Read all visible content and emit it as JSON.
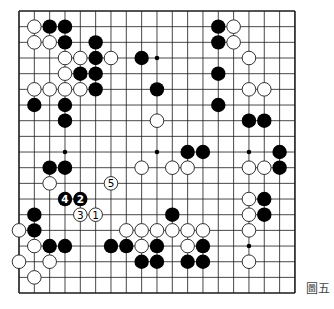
{
  "diagram": {
    "type": "go-board",
    "size": 19,
    "caption": "圖五",
    "colors": {
      "background": "#ffffff",
      "grid": "#1a1a1a",
      "black_stone": "#000000",
      "white_stone_fill": "#ffffff",
      "white_stone_stroke": "#1a1a1a"
    },
    "star_points_visible": [
      [
        3,
        9
      ],
      [
        9,
        3
      ],
      [
        9,
        9
      ],
      [
        15,
        9
      ],
      [
        15,
        15
      ]
    ],
    "black_stones": [
      [
        2,
        1
      ],
      [
        3,
        1
      ],
      [
        13,
        1
      ],
      [
        3,
        2
      ],
      [
        5,
        2
      ],
      [
        13,
        2
      ],
      [
        5,
        3
      ],
      [
        8,
        3
      ],
      [
        4,
        4
      ],
      [
        5,
        4
      ],
      [
        13,
        4
      ],
      [
        5,
        5
      ],
      [
        9,
        5
      ],
      [
        1,
        6
      ],
      [
        3,
        6
      ],
      [
        13,
        6
      ],
      [
        3,
        7
      ],
      [
        15,
        7
      ],
      [
        16,
        7
      ],
      [
        11,
        9
      ],
      [
        12,
        9
      ],
      [
        17,
        9
      ],
      [
        2,
        10
      ],
      [
        3,
        10
      ],
      [
        17,
        10
      ],
      [
        16,
        12
      ],
      [
        1,
        13
      ],
      [
        10,
        13
      ],
      [
        16,
        13
      ],
      [
        1,
        14
      ],
      [
        2,
        15
      ],
      [
        3,
        15
      ],
      [
        6,
        15
      ],
      [
        7,
        15
      ],
      [
        9,
        15
      ],
      [
        12,
        15
      ],
      [
        8,
        16
      ],
      [
        9,
        16
      ],
      [
        11,
        16
      ],
      [
        12,
        16
      ]
    ],
    "white_stones": [
      [
        1,
        1
      ],
      [
        14,
        1
      ],
      [
        1,
        2
      ],
      [
        2,
        2
      ],
      [
        14,
        2
      ],
      [
        3,
        3
      ],
      [
        4,
        3
      ],
      [
        6,
        3
      ],
      [
        15,
        3
      ],
      [
        3,
        4
      ],
      [
        1,
        5
      ],
      [
        2,
        5
      ],
      [
        3,
        5
      ],
      [
        4,
        5
      ],
      [
        15,
        5
      ],
      [
        16,
        5
      ],
      [
        9,
        7
      ],
      [
        8,
        10
      ],
      [
        10,
        10
      ],
      [
        11,
        10
      ],
      [
        15,
        10
      ],
      [
        16,
        10
      ],
      [
        2,
        11
      ],
      [
        15,
        12
      ],
      [
        15,
        13
      ],
      [
        0,
        14
      ],
      [
        7,
        14
      ],
      [
        8,
        14
      ],
      [
        9,
        14
      ],
      [
        10,
        14
      ],
      [
        11,
        14
      ],
      [
        12,
        14
      ],
      [
        15,
        14
      ],
      [
        1,
        15
      ],
      [
        8,
        15
      ],
      [
        11,
        15
      ],
      [
        0,
        16
      ],
      [
        2,
        16
      ],
      [
        15,
        16
      ],
      [
        1,
        17
      ]
    ],
    "numbered_moves": [
      {
        "n": "1",
        "color": "white",
        "col": 5,
        "row": 13
      },
      {
        "n": "2",
        "color": "black",
        "col": 4,
        "row": 12
      },
      {
        "n": "3",
        "color": "white",
        "col": 4,
        "row": 13
      },
      {
        "n": "4",
        "color": "black",
        "col": 3,
        "row": 12
      },
      {
        "n": "5",
        "color": "white",
        "col": 6,
        "row": 11
      }
    ]
  }
}
